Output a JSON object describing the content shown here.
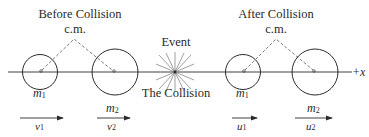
{
  "diagram": {
    "axis": {
      "label": "+x"
    },
    "before": {
      "title": "Before Collision",
      "cm_label": "c.m.",
      "mass1": {
        "label": "m",
        "sub": "1",
        "velocity_label": "v",
        "velocity_sub": "1"
      },
      "mass2": {
        "label": "m",
        "sub": "2",
        "velocity_label": "v",
        "velocity_sub": "2"
      }
    },
    "event": {
      "top_label": "Event",
      "bottom_label": "The Collision"
    },
    "after": {
      "title": "After Collision",
      "cm_label": "c.m.",
      "mass1": {
        "label": "m",
        "sub": "1",
        "velocity_label": "u",
        "velocity_sub": "1"
      },
      "mass2": {
        "label": "m",
        "sub": "2",
        "velocity_label": "u",
        "velocity_sub": "2"
      }
    },
    "colors": {
      "ink": "#2a2a2a",
      "dashed": "#555555"
    }
  }
}
